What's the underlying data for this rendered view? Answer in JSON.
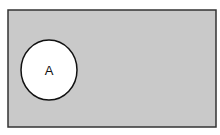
{
  "diagram": {
    "type": "venn",
    "universe": {
      "x": 8,
      "y": 10,
      "width": 208,
      "height": 117,
      "fill": "#c9c9c9",
      "stroke": "#333333"
    },
    "sets": [
      {
        "label": "A",
        "cx": 49,
        "cy": 70,
        "rx": 28,
        "ry": 30,
        "fill": "#ffffff",
        "stroke": "#111111"
      }
    ]
  }
}
